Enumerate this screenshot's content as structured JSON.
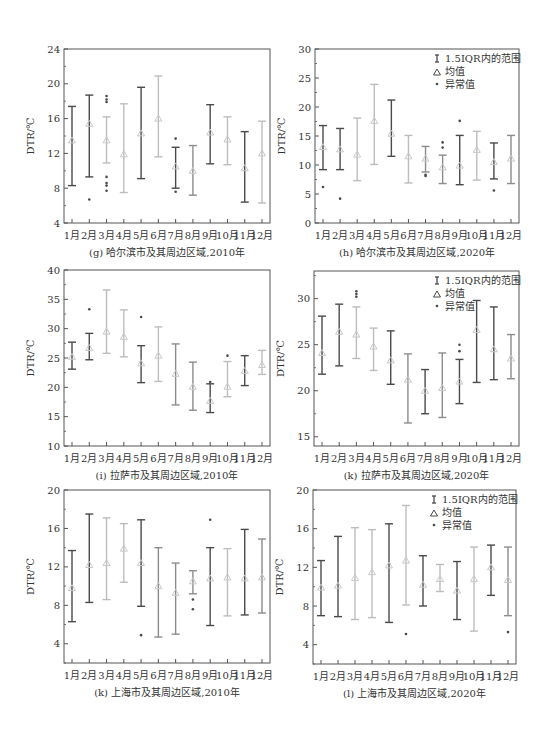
{
  "figure": {
    "months": [
      "1月",
      "2月",
      "3月",
      "4月",
      "5月",
      "6月",
      "7月",
      "8月",
      "9月",
      "10月",
      "11月",
      "12月"
    ],
    "legend": {
      "range": "1.5IQR内的范围",
      "mean": "均值",
      "outlier": "异常值"
    },
    "ylabel": "DTR/℃"
  },
  "chart_data": [
    {
      "type": "box-whisker",
      "id": "g",
      "title": "(g) 哈尔滨市及其周边区域,2010年",
      "ylabel": "DTR/℃",
      "ylim": [
        4,
        24
      ],
      "yticks": [
        4,
        8,
        12,
        16,
        20,
        24
      ],
      "legend": false,
      "frame": [
        64,
        49,
        270,
        223
      ],
      "categories": [
        "1月",
        "2月",
        "3月",
        "4月",
        "5月",
        "6月",
        "7月",
        "8月",
        "9月",
        "10月",
        "11月",
        "12月"
      ],
      "upper": [
        17.4,
        18.7,
        16.2,
        17.7,
        19.6,
        20.9,
        12.7,
        12.9,
        17.6,
        16.2,
        14.5,
        15.7
      ],
      "lower": [
        8.3,
        9.3,
        10.9,
        7.5,
        9.1,
        11.6,
        8.0,
        7.2,
        10.8,
        10.7,
        6.4,
        6.3
      ],
      "mean": [
        13.5,
        15.4,
        13.5,
        11.9,
        14.3,
        16.0,
        10.5,
        10.0,
        14.4,
        13.6,
        10.3,
        12.0
      ],
      "outliers": [
        [],
        [
          6.7
        ],
        [
          18.6,
          18.2,
          17.9,
          9.3,
          8.6,
          8.3,
          7.7
        ],
        [],
        [],
        [],
        [
          13.7,
          7.6
        ],
        [],
        [],
        [],
        [],
        []
      ]
    },
    {
      "type": "box-whisker",
      "id": "h",
      "title": "(h) 哈尔滨市及其周边区域,2020年",
      "ylabel": "DTR/℃",
      "ylim": [
        0,
        30
      ],
      "yticks": [
        0,
        5,
        10,
        15,
        20,
        25,
        30
      ],
      "legend": true,
      "frame": [
        315,
        49,
        519,
        223
      ],
      "categories": [
        "1月",
        "2月",
        "3月",
        "4月",
        "5月",
        "6月",
        "7月",
        "8月",
        "9月",
        "10月",
        "11月",
        "12月"
      ],
      "upper": [
        16.8,
        16.3,
        18.1,
        23.9,
        21.2,
        15.1,
        13.2,
        11.7,
        15.1,
        15.8,
        13.8,
        15.1
      ],
      "lower": [
        9.2,
        9.2,
        7.3,
        10.1,
        11.5,
        6.9,
        8.8,
        6.8,
        6.6,
        7.4,
        7.6,
        6.8
      ],
      "mean": [
        13.1,
        12.7,
        11.8,
        17.6,
        15.4,
        11.5,
        11.1,
        9.6,
        9.9,
        12.6,
        10.5,
        11.1
      ],
      "outliers": [
        [
          6.2
        ],
        [
          4.2
        ],
        [],
        [],
        [],
        [],
        [
          8.3,
          8.1
        ],
        [
          13.9,
          13.0
        ],
        [
          17.6
        ],
        [],
        [
          5.6
        ],
        []
      ]
    },
    {
      "type": "box-whisker",
      "id": "i",
      "title": "(i) 拉萨市及其周边区域,2010年",
      "ylabel": "DTR/℃",
      "ylim": [
        10,
        40
      ],
      "yticks": [
        10,
        15,
        20,
        25,
        30,
        35,
        40
      ],
      "legend": false,
      "frame": [
        64,
        270,
        270,
        446
      ],
      "categories": [
        "1月",
        "2月",
        "3月",
        "4月",
        "5月",
        "6月",
        "7月",
        "8月",
        "9月",
        "10月",
        "11月",
        "12月"
      ],
      "upper": [
        27.7,
        29.2,
        36.6,
        33.2,
        27.1,
        30.3,
        27.4,
        24.3,
        20.6,
        24.4,
        25.4,
        26.3
      ],
      "lower": [
        23.1,
        24.7,
        25.8,
        25.2,
        20.8,
        21.0,
        17.0,
        16.1,
        15.7,
        18.4,
        20.3,
        22.2
      ],
      "mean": [
        25.2,
        26.7,
        29.5,
        28.6,
        24.1,
        25.4,
        22.3,
        20.1,
        17.7,
        20.1,
        22.8,
        23.8
      ],
      "outliers": [
        [],
        [
          33.3
        ],
        [],
        [],
        [
          32.0
        ],
        [],
        [],
        [],
        [
          20.9
        ],
        [
          25.4
        ],
        [],
        []
      ]
    },
    {
      "type": "box-whisker",
      "id": "k-lhasa-2020",
      "title": "(k) 拉萨市及其周边区域,2020年",
      "ylabel": "DTR/℃",
      "ylim": [
        14,
        33
      ],
      "yticks": [
        15,
        20,
        25,
        30
      ],
      "legend": true,
      "frame": [
        314,
        271,
        519,
        446
      ],
      "categories": [
        "1月",
        "2月",
        "3月",
        "4月",
        "5月",
        "6月",
        "7月",
        "8月",
        "9月",
        "10月",
        "11月",
        "12月"
      ],
      "upper": [
        28.1,
        29.4,
        29.1,
        26.8,
        26.5,
        24.0,
        22.3,
        24.1,
        23.4,
        29.8,
        29.1,
        26.1
      ],
      "lower": [
        21.8,
        22.7,
        23.5,
        22.2,
        20.7,
        16.5,
        17.5,
        17.1,
        18.6,
        20.9,
        21.2,
        21.3
      ],
      "mean": [
        24.1,
        26.4,
        26.1,
        24.8,
        23.3,
        21.2,
        20.0,
        20.3,
        21.0,
        26.6,
        24.5,
        23.5
      ],
      "outliers": [
        [],
        [],
        [
          30.8,
          30.5,
          30.2
        ],
        [],
        [],
        [],
        [],
        [],
        [
          25.0,
          24.3
        ],
        [],
        [],
        []
      ]
    },
    {
      "type": "box-whisker",
      "id": "k",
      "title": "(k) 上海市及其周边区域,2010年",
      "ylabel": "DTR/℃",
      "ylim": [
        2,
        20
      ],
      "yticks": [
        4,
        8,
        12,
        16,
        20
      ],
      "legend": false,
      "frame": [
        64,
        490,
        270,
        663
      ],
      "categories": [
        "1月",
        "2月",
        "3月",
        "4月",
        "5月",
        "6月",
        "7月",
        "8月",
        "9月",
        "10月",
        "11月",
        "12月"
      ],
      "upper": [
        13.7,
        17.5,
        17.1,
        16.5,
        16.9,
        14.0,
        12.4,
        11.6,
        14.0,
        13.9,
        15.9,
        14.9
      ],
      "lower": [
        6.3,
        8.3,
        8.6,
        10.4,
        7.9,
        4.7,
        5.0,
        9.2,
        5.9,
        6.9,
        7.0,
        7.2
      ],
      "mean": [
        9.8,
        12.2,
        12.4,
        13.9,
        12.4,
        10.0,
        9.3,
        10.5,
        10.8,
        10.9,
        10.8,
        10.9
      ],
      "outliers": [
        [],
        [],
        [],
        [],
        [
          4.9
        ],
        [],
        [],
        [
          8.6,
          7.6
        ],
        [
          16.9
        ],
        [],
        [],
        []
      ]
    },
    {
      "type": "box-whisker",
      "id": "l",
      "title": "(l) 上海市及其周边区域,2020年",
      "ylabel": "DTR/℃",
      "ylim": [
        2,
        20
      ],
      "yticks": [
        4,
        8,
        12,
        16,
        20
      ],
      "legend": true,
      "frame": [
        313,
        490,
        516,
        664
      ],
      "categories": [
        "1月",
        "2月",
        "3月",
        "4月",
        "5月",
        "6月",
        "7月",
        "8月",
        "9月",
        "10月",
        "11月",
        "12月"
      ],
      "upper": [
        12.7,
        15.2,
        16.1,
        15.9,
        16.5,
        18.4,
        13.2,
        12.3,
        12.6,
        14.1,
        14.3,
        14.1
      ],
      "lower": [
        7.0,
        6.9,
        6.6,
        6.8,
        6.3,
        8.1,
        8.0,
        9.5,
        6.6,
        5.4,
        9.1,
        7.0
      ],
      "mean": [
        9.9,
        10.1,
        10.9,
        11.5,
        12.2,
        12.7,
        10.2,
        10.8,
        9.6,
        10.8,
        12.0,
        10.7
      ],
      "outliers": [
        [],
        [],
        [],
        [],
        [],
        [
          5.1
        ],
        [],
        [],
        [],
        [],
        [],
        [
          5.3
        ]
      ]
    }
  ],
  "colors": {
    "dark": "#4a4a4a",
    "mid": "#8c8c8c",
    "light": "#bdbdbd",
    "frame": "#555555",
    "text": "#333333"
  },
  "month_shades": {
    "g": [
      "dark",
      "dark",
      "light",
      "light",
      "dark",
      "light",
      "dark",
      "mid",
      "dark",
      "light",
      "dark",
      "light"
    ],
    "h": [
      "dark",
      "dark",
      "light",
      "light",
      "dark",
      "light",
      "mid",
      "mid",
      "dark",
      "light",
      "dark",
      "mid"
    ],
    "i": [
      "dark",
      "dark",
      "light",
      "light",
      "dark",
      "light",
      "mid",
      "mid",
      "dark",
      "light",
      "dark",
      "light"
    ],
    "k-lhasa-2020": [
      "dark",
      "dark",
      "light",
      "light",
      "dark",
      "mid",
      "dark",
      "mid",
      "dark",
      "dark",
      "dark",
      "mid"
    ],
    "k": [
      "dark",
      "dark",
      "light",
      "light",
      "dark",
      "mid",
      "mid",
      "mid",
      "dark",
      "light",
      "dark",
      "mid"
    ],
    "l": [
      "dark",
      "dark",
      "light",
      "light",
      "dark",
      "light",
      "dark",
      "light",
      "dark",
      "light",
      "dark",
      "mid"
    ]
  }
}
